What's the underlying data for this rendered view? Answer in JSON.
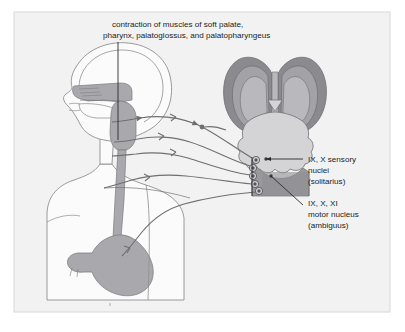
{
  "figure": {
    "name": "vagal-glossopharyngeal-pathway-diagram",
    "panel": {
      "background_color": "#f2f2f2",
      "border_color": "#d8d8d8",
      "outer_background_color": "#ffffff"
    },
    "palette": {
      "line_color": "#6f6f73",
      "outline_color": "#8e8e92",
      "text_color": "#1c1c1c",
      "mucosa_gray": "#a9a9ad",
      "stomach_gray": "#a9a9ad",
      "body_fill": "#fbfbfb",
      "cerebrum_dark": "#8b8b8f",
      "cerebrum_mid": "#a3a3a7",
      "cerebrum_light": "#b9b9bd",
      "cerebellum_fill": "#d4d4d6",
      "medulla_fill": "#9a9a9e",
      "nucleus_fill": "#6a6a6e"
    }
  },
  "caption": {
    "name": "contraction-caption",
    "line1": "contraction of muscles of soft palate,",
    "line2": "pharynx, palatoglossus, and palatopharyngeus"
  },
  "labels": {
    "sensory": {
      "name": "sensory-nuclei-label",
      "line1": "IX, X sensory",
      "line2": "nuclei",
      "line3": "(solitarius)"
    },
    "motor": {
      "name": "motor-nucleus-label",
      "line1": "IX, X, XI",
      "line2": "motor nucleus",
      "line3": "(ambiguus)"
    }
  },
  "anatomy": {
    "body_figure": "sagittal-upper-body-silhouette",
    "structures": [
      "head-profile",
      "nasal-cavity",
      "oral-cavity",
      "soft-palate",
      "pharynx",
      "esophagus",
      "stomach",
      "torso"
    ],
    "brain_figure": "posterior-brainstem-view",
    "brain_structures": [
      "cerebral-hemisphere-left",
      "cerebral-hemisphere-right",
      "cerebellum",
      "medulla-cut-surface",
      "cranial-nerve-nuclei"
    ],
    "nerve_pathways": {
      "count": 5,
      "direction": "brainstem-to-viscera",
      "arrow_count": 5
    },
    "nuclei_dots": 5
  }
}
